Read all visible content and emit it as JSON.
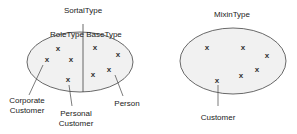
{
  "diagrams": [
    {
      "title": "SortalType",
      "sections": [
        {
          "label": "RoleType"
        },
        {
          "label": "BaseType"
        }
      ],
      "annotations": [
        {
          "label_line1": "Corporate",
          "label_line2": "Customer"
        },
        {
          "label_line1": "Personal",
          "label_line2": "Customer"
        },
        {
          "label_line1": "Person",
          "label_line2": ""
        }
      ],
      "marker": "x"
    },
    {
      "title": "MixinType",
      "annotations": [
        {
          "label_line1": "Customer"
        }
      ],
      "marker": "x"
    }
  ],
  "colors": {
    "ellipse_fill": "#f1f1f1",
    "ellipse_stroke": "#444444",
    "text": "#222222"
  }
}
